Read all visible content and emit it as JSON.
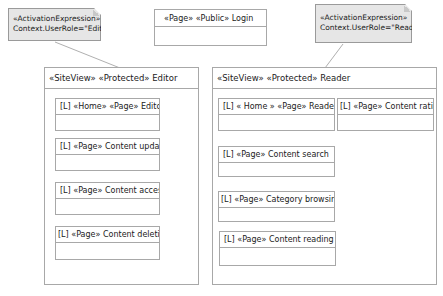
{
  "notes": [
    {
      "line1": "«ActivationExpression»",
      "line2": "Context.UserRole=\"Editor\""
    },
    {
      "line1": "«ActivationExpression»",
      "line2": "Context.UserRole=\"Reader\""
    }
  ],
  "login_page": {
    "label": "«Page» «Public» Login"
  },
  "site_views": {
    "editor": {
      "label": "«SiteView» «Protected» Editor",
      "pages": [
        {
          "label": "[L] «Home» «Page» Editor"
        },
        {
          "label": "[L] «Page» Content update"
        },
        {
          "label": "[L] «Page» Content access"
        },
        {
          "label": "[L] «Page» Content deletion"
        }
      ]
    },
    "reader": {
      "label": "«SiteView» «Protected» Reader",
      "pages": [
        {
          "label": "[L]  « Home » «Page» Reader"
        },
        {
          "label": "[L] «Page» Content rating"
        },
        {
          "label": "[L] «Page» Content search"
        },
        {
          "label": "[L] «Page» Category browsing"
        },
        {
          "label": "[L] «Page» Content reading"
        }
      ]
    }
  },
  "colors": {
    "note_fill": "#e6e6e6",
    "border": "#a8a8a8",
    "background": "#ffffff"
  }
}
